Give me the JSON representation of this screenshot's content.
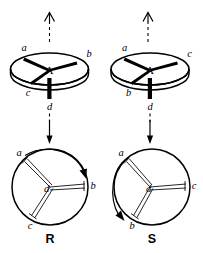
{
  "figure": {
    "background_color": "#ffffff",
    "ink_color": "#000000"
  },
  "panels": [
    {
      "id": "panel-r",
      "config_label": "R",
      "top_model": {
        "center_atom": "A",
        "view_arrow": "eye-view-arrow-up",
        "substituents": [
          {
            "name": "a",
            "label": "a",
            "position": "upper-left"
          },
          {
            "name": "b",
            "label": "b",
            "position": "right"
          },
          {
            "name": "c",
            "label": "c",
            "position": "lower-left"
          },
          {
            "name": "d",
            "label": "d",
            "position": "below-stem"
          }
        ]
      },
      "transition_arrow": "down-arrow",
      "bottom_projection": {
        "center_atom": "d",
        "rotation_direction": "clockwise",
        "substituents": [
          {
            "name": "a",
            "label": "a",
            "position": "upper-left"
          },
          {
            "name": "b",
            "label": "b",
            "position": "right"
          },
          {
            "name": "c",
            "label": "c",
            "position": "lower-left"
          }
        ]
      }
    },
    {
      "id": "panel-s",
      "config_label": "S",
      "top_model": {
        "center_atom": "A",
        "view_arrow": "eye-view-arrow-up",
        "substituents": [
          {
            "name": "a",
            "label": "a",
            "position": "upper-left"
          },
          {
            "name": "c",
            "label": "c",
            "position": "right"
          },
          {
            "name": "b",
            "label": "b",
            "position": "lower-left"
          },
          {
            "name": "d",
            "label": "d",
            "position": "below-stem"
          }
        ]
      },
      "transition_arrow": "down-arrow",
      "bottom_projection": {
        "center_atom": "d",
        "rotation_direction": "counterclockwise",
        "substituents": [
          {
            "name": "a",
            "label": "a",
            "position": "upper-left"
          },
          {
            "name": "c",
            "label": "c",
            "position": "right"
          },
          {
            "name": "b",
            "label": "b",
            "position": "lower-left"
          }
        ]
      }
    }
  ]
}
